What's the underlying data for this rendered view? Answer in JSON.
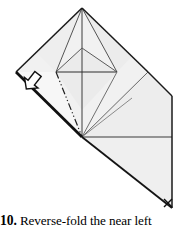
{
  "figure": {
    "colors": {
      "paper_fill": "#f0f0f0",
      "paper_fill_light": "#f6f6f6",
      "paper_fill_shade": "#e8e8e8",
      "outline": "#1a1a1a",
      "crease": "#4a4a4a",
      "crease_light": "#8a8a8a",
      "background": "#ffffff"
    },
    "marks": {
      "x_mark": "×",
      "x_mark_name": "x-corner-mark",
      "arrow_name": "reverse-fold-arrow",
      "arrow_direction": "down-left",
      "fold_line_style": "dash-dot-dot"
    }
  },
  "caption": {
    "step_number": "10.",
    "text": "Reverse-fold the near left"
  }
}
